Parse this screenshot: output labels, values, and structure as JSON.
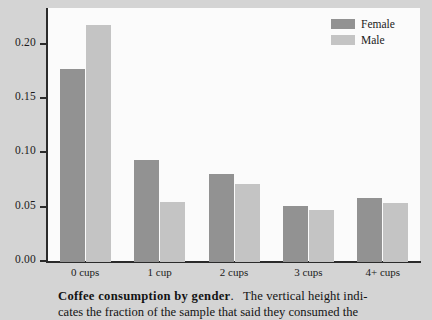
{
  "chart_data": {
    "type": "bar",
    "title": "",
    "xlabel": "",
    "ylabel": "",
    "categories": [
      "0 cups",
      "1 cup",
      "2 cups",
      "3 cups",
      "4+ cups"
    ],
    "series": [
      {
        "name": "Female",
        "color": "#929292",
        "values": [
          0.178,
          0.094,
          0.081,
          0.052,
          0.059
        ]
      },
      {
        "name": "Male",
        "color": "#c4c4c4",
        "values": [
          0.218,
          0.055,
          0.072,
          0.048,
          0.054
        ]
      }
    ],
    "ylim": [
      0.0,
      0.233
    ],
    "yticks": [
      0.0,
      0.05,
      0.1,
      0.15,
      0.2
    ],
    "ytick_labels": [
      "0.00",
      "0.05",
      "0.10",
      "0.15",
      "0.20"
    ],
    "grid": false,
    "legend_position": "top-right"
  },
  "legend": {
    "entries": [
      {
        "label": "Female",
        "color": "#929292"
      },
      {
        "label": "Male",
        "color": "#c4c4c4"
      }
    ]
  },
  "caption": {
    "title": "Coffee consumption by gender",
    "title_suffix": ".",
    "body": "The vertical height indi-",
    "line2": "cates the fraction of the sample that said they consumed the"
  }
}
